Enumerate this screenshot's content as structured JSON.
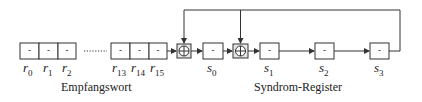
{
  "diagram": {
    "empfangswort": {
      "caption": "Empfangswort",
      "cells_left": [
        {
          "value": "-",
          "label": "r",
          "index": "0"
        },
        {
          "value": "-",
          "label": "r",
          "index": "1"
        },
        {
          "value": "-",
          "label": "r",
          "index": "2"
        }
      ],
      "ellipsis": "........",
      "cells_right": [
        {
          "value": "-",
          "label": "r",
          "index": "13"
        },
        {
          "value": "-",
          "label": "r",
          "index": "14"
        },
        {
          "value": "-",
          "label": "r",
          "index": "15"
        }
      ]
    },
    "syndrom_register": {
      "caption": "Syndrom-Register",
      "cells": [
        {
          "value": "-",
          "label": "s",
          "index": "0"
        },
        {
          "value": "-",
          "label": "s",
          "index": "1"
        },
        {
          "value": "-",
          "label": "s",
          "index": "2"
        },
        {
          "value": "-",
          "label": "s",
          "index": "3"
        }
      ]
    },
    "xor_gates": [
      {
        "symbol": "⊕"
      },
      {
        "symbol": "⊕"
      }
    ],
    "colors": {
      "line": "#333333",
      "box_fill": "#ffffff",
      "xor_fill": "#e6e6e6"
    }
  }
}
